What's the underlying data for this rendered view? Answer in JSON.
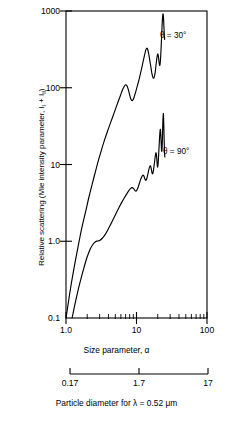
{
  "chart_data": {
    "type": "line",
    "title": "",
    "xlabel": "Size parameter, α",
    "ylabel": "Relative scattering (Mie intensity parameter, I₁ + I₁₁)",
    "ylabel_main": "Relative scattering (Mie intensity parameter, I",
    "ylabel_sub1": "l",
    "ylabel_mid": " + I",
    "ylabel_sub2": "ll",
    "ylabel_end": ")",
    "xscale": "log",
    "yscale": "log",
    "xlim": [
      1.0,
      100
    ],
    "ylim": [
      0.1,
      2000
    ],
    "grid": false,
    "legend_position": "inline-annotation",
    "xticks": [
      "1.0",
      "10",
      "100"
    ],
    "xtick_values": [
      1.0,
      10,
      100
    ],
    "yticks": [
      "0.1",
      "1.0",
      "10",
      "100",
      "1000"
    ],
    "ytick_values": [
      0.1,
      1.0,
      10,
      100,
      1000
    ],
    "secondary_axis": {
      "label": "Particle diameter for λ = 0.52 μm",
      "ticks": [
        "0.17",
        "1.7",
        "17"
      ],
      "tick_values": [
        0.17,
        1.7,
        17
      ],
      "unit": "μm",
      "wavelength": "0.52"
    },
    "series": [
      {
        "name": "θ = 30°",
        "annotation": "θ = 30°",
        "color": "#000000",
        "points": [
          [
            1.0,
            0.1
          ],
          [
            1.06,
            0.145
          ],
          [
            1.12,
            0.21
          ],
          [
            1.2,
            0.32
          ],
          [
            1.3,
            0.5
          ],
          [
            1.42,
            0.8
          ],
          [
            1.55,
            1.25
          ],
          [
            1.7,
            1.95
          ],
          [
            1.9,
            3.1
          ],
          [
            2.1,
            4.8
          ],
          [
            2.35,
            7.5
          ],
          [
            2.6,
            11.0
          ],
          [
            2.9,
            16.5
          ],
          [
            3.2,
            23.0
          ],
          [
            3.55,
            32.0
          ],
          [
            3.9,
            42.0
          ],
          [
            4.3,
            55.0
          ],
          [
            4.7,
            70.0
          ],
          [
            5.1,
            88.0
          ],
          [
            5.5,
            108.0
          ],
          [
            5.9,
            130.0
          ],
          [
            6.3,
            155.0
          ],
          [
            6.7,
            175.0
          ],
          [
            7.0,
            185.0
          ],
          [
            7.3,
            180.0
          ],
          [
            7.6,
            162.0
          ],
          [
            7.9,
            140.0
          ],
          [
            8.2,
            122.0
          ],
          [
            8.5,
            113.0
          ],
          [
            8.8,
            112.0
          ],
          [
            9.2,
            122.0
          ],
          [
            9.7,
            145.0
          ],
          [
            10.3,
            180.0
          ],
          [
            11.0,
            230.0
          ],
          [
            11.7,
            300.0
          ],
          [
            12.4,
            390.0
          ],
          [
            13.0,
            480.0
          ],
          [
            13.5,
            560.0
          ],
          [
            13.9,
            600.0
          ],
          [
            14.3,
            590.0
          ],
          [
            14.8,
            520.0
          ],
          [
            15.3,
            430.0
          ],
          [
            15.9,
            340.0
          ],
          [
            16.5,
            270.0
          ],
          [
            17.1,
            235.0
          ],
          [
            17.6,
            230.0
          ],
          [
            18.1,
            250.0
          ],
          [
            18.6,
            300.0
          ],
          [
            19.1,
            380.0
          ],
          [
            19.6,
            460.0
          ],
          [
            20.0,
            500.0
          ],
          [
            20.4,
            470.0
          ],
          [
            20.8,
            400.0
          ],
          [
            21.2,
            350.0
          ],
          [
            21.6,
            360.0
          ],
          [
            22.0,
            450.0
          ],
          [
            22.4,
            640.0
          ],
          [
            22.8,
            950.0
          ],
          [
            23.2,
            1400.0
          ],
          [
            23.6,
            1750.0
          ],
          [
            23.9,
            1800.0
          ],
          [
            24.2,
            1550.0
          ],
          [
            24.5,
            1180.0
          ],
          [
            24.8,
            930.0
          ],
          [
            25.1,
            800.0
          ]
        ]
      },
      {
        "name": "θ = 90°",
        "annotation": "θ = 90°",
        "color": "#000000",
        "points": [
          [
            1.22,
            0.1
          ],
          [
            1.3,
            0.135
          ],
          [
            1.4,
            0.19
          ],
          [
            1.52,
            0.27
          ],
          [
            1.66,
            0.38
          ],
          [
            1.82,
            0.53
          ],
          [
            2.0,
            0.72
          ],
          [
            2.2,
            0.92
          ],
          [
            2.42,
            1.08
          ],
          [
            2.62,
            1.17
          ],
          [
            2.8,
            1.2
          ],
          [
            3.0,
            1.22
          ],
          [
            3.25,
            1.3
          ],
          [
            3.55,
            1.45
          ],
          [
            3.9,
            1.7
          ],
          [
            4.3,
            2.05
          ],
          [
            4.75,
            2.5
          ],
          [
            5.2,
            3.0
          ],
          [
            5.7,
            3.6
          ],
          [
            6.2,
            4.2
          ],
          [
            6.7,
            4.8
          ],
          [
            7.2,
            5.4
          ],
          [
            7.7,
            6.0
          ],
          [
            8.2,
            6.5
          ],
          [
            8.7,
            6.7
          ],
          [
            9.1,
            6.5
          ],
          [
            9.5,
            6.1
          ],
          [
            9.9,
            6.0
          ],
          [
            10.3,
            6.4
          ],
          [
            10.8,
            7.3
          ],
          [
            11.3,
            8.4
          ],
          [
            11.8,
            9.4
          ],
          [
            12.3,
            10.0
          ],
          [
            12.7,
            9.8
          ],
          [
            13.1,
            9.0
          ],
          [
            13.5,
            8.5
          ],
          [
            13.9,
            8.8
          ],
          [
            14.4,
            10.0
          ],
          [
            14.9,
            11.8
          ],
          [
            15.4,
            13.2
          ],
          [
            15.8,
            13.5
          ],
          [
            16.2,
            12.3
          ],
          [
            16.6,
            10.8
          ],
          [
            17.0,
            10.5
          ],
          [
            17.4,
            11.8
          ],
          [
            17.9,
            14.5
          ],
          [
            18.4,
            18.0
          ],
          [
            18.8,
            20.5
          ],
          [
            19.1,
            20.0
          ],
          [
            19.4,
            17.0
          ],
          [
            19.7,
            14.0
          ],
          [
            20.0,
            13.0
          ],
          [
            20.3,
            15.0
          ],
          [
            20.7,
            21.0
          ],
          [
            21.1,
            30.0
          ],
          [
            21.5,
            40.0
          ],
          [
            21.8,
            44.0
          ],
          [
            22.1,
            38.0
          ],
          [
            22.4,
            28.0
          ],
          [
            22.7,
            22.0
          ],
          [
            23.0,
            23.0
          ],
          [
            23.3,
            32.0
          ],
          [
            23.6,
            52.0
          ],
          [
            23.9,
            70.0
          ],
          [
            24.1,
            72.0
          ],
          [
            24.3,
            58.0
          ],
          [
            24.5,
            42.0
          ],
          [
            24.7,
            30.0
          ],
          [
            24.9,
            23.0
          ],
          [
            25.1,
            19.0
          ],
          [
            25.3,
            18.0
          ]
        ]
      }
    ]
  }
}
